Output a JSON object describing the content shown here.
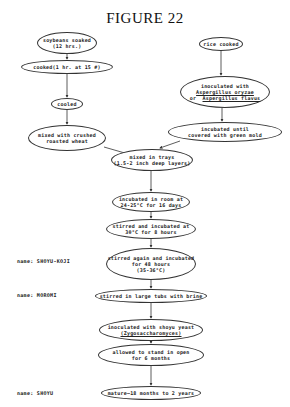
{
  "title": "FIGURE 22",
  "nodes": {
    "soybeans": {
      "line1": "soybeans soaked",
      "line2": "(12 hrs.)"
    },
    "cooked": {
      "line1": "cooked(1 hr. at 15 #)"
    },
    "cooled": {
      "line1": "cooled"
    },
    "mixed_wheat": {
      "line1": "mixed with crushed",
      "line2": "roasted wheat"
    },
    "rice": {
      "line1": "rice cooked"
    },
    "inoculated_asp": {
      "line1": "inoculated with",
      "line2": "Aspergillus oryzae",
      "line3_prefix": "or",
      "line3": "Aspergillus flavus"
    },
    "incubated_mold": {
      "line1": "incubated until",
      "line2": "covered with green mold"
    },
    "trays": {
      "line1": "mixed in trays",
      "line2": "(1.5-2 inch deep layers)"
    },
    "room": {
      "line1": "incubated in room at",
      "line2": "24-25°C for 16 days"
    },
    "stirred1": {
      "line1": "stirred and incubated at",
      "line2": "30°C for 8 hours"
    },
    "stirred2": {
      "line1": "stirred again and incubated",
      "line2": "for 48 hours",
      "line3": "(35-36°C)"
    },
    "tubs": {
      "line1": "stirred in large tubs with brine"
    },
    "yeast": {
      "line1": "inoculated with shoyu yeast",
      "line2": "(Zygosaccharomyces)"
    },
    "stand": {
      "line1": "allowed to stand in open",
      "line2": "for 6 months"
    },
    "mature": {
      "line1": "mature—18 months to 2 years"
    }
  },
  "labels": {
    "koji": "name: SHOYU-KOJI",
    "moromi": "name: MOROMI",
    "shoyu": "name: SHOYU"
  }
}
